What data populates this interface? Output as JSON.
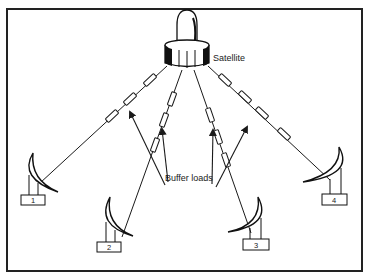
{
  "diagram": {
    "satellite": {
      "label": "Satellite"
    },
    "buffer": {
      "label": "Buffer loads"
    },
    "stations": [
      {
        "label": "1"
      },
      {
        "label": "2"
      },
      {
        "label": "3"
      },
      {
        "label": "4"
      }
    ],
    "colors": {
      "ink": "#1a1a1a",
      "background": "#ffffff"
    }
  }
}
